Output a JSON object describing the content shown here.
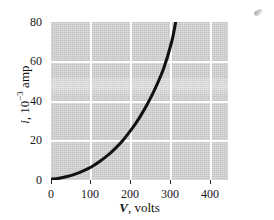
{
  "figure": {
    "caption_none": "",
    "background_color": "#ffffff",
    "plot_background_color": "#d2d2d2",
    "gridline_color": "#ffffff",
    "curve_color": "#111111"
  },
  "axes": {
    "y": {
      "label_prefix": "i",
      "label_mid": ", 10",
      "label_exponent": "−3",
      "label_suffix": " amp",
      "label_plain": "i, 10−3 amp",
      "ticks": [
        "0",
        "20",
        "40",
        "60",
        "80"
      ],
      "tick_values": [
        0,
        20,
        40,
        60,
        80
      ],
      "min": 0,
      "max": 80
    },
    "x": {
      "label_var": "V",
      "label_rest": ", volts",
      "label_plain": "V, volts",
      "ticks": [
        "0",
        "100",
        "200",
        "300",
        "400"
      ],
      "tick_values": [
        0,
        100,
        200,
        300,
        400
      ],
      "min": 0,
      "max": 440
    }
  },
  "artifacts": {
    "scan_speck": "scan-speck"
  },
  "chart_data": {
    "type": "line",
    "title": "",
    "subtitle": "",
    "xlabel": "V, volts",
    "ylabel": "i, 10−3 amp",
    "xlim": [
      0,
      440
    ],
    "ylim": [
      0,
      80
    ],
    "xticks": [
      0,
      100,
      200,
      300,
      400
    ],
    "yticks": [
      0,
      20,
      40,
      60,
      80
    ],
    "grid": true,
    "legend": null,
    "legend_position": "none",
    "annotations": [],
    "series": [
      {
        "name": "current vs voltage",
        "color": "#111111",
        "linewidth": 3,
        "x": [
          0,
          20,
          40,
          60,
          80,
          100,
          120,
          140,
          160,
          180,
          200,
          220,
          240,
          260,
          280,
          300,
          310
        ],
        "y": [
          0.4,
          0.9,
          1.8,
          3.0,
          4.6,
          6.6,
          9.2,
          12.3,
          16.0,
          20.4,
          25.6,
          31.6,
          38.6,
          46.8,
          56.4,
          70.0,
          80.0
        ]
      }
    ]
  }
}
